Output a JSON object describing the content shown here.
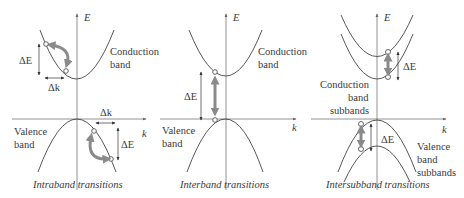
{
  "panels": [
    {
      "id": "intraband",
      "caption": "Intraband transitions",
      "axis_labels": {
        "energy": "E",
        "momentum": "k"
      },
      "band_labels": {
        "conduction_line1": "Conduction",
        "conduction_line2": "band",
        "valence_line1": "Valence",
        "valence_line2": "band"
      },
      "annotations": {
        "conduction_dE": "ΔE",
        "conduction_dk": "Δk",
        "valence_dk": "Δk",
        "valence_dE": "ΔE"
      }
    },
    {
      "id": "interband",
      "caption": "Interband transitions",
      "axis_labels": {
        "energy": "E",
        "momentum": "k"
      },
      "band_labels": {
        "conduction_line1": "Conduction",
        "conduction_line2": "band",
        "valence_line1": "Valence",
        "valence_line2": "band"
      },
      "annotations": {
        "dE": "ΔE"
      }
    },
    {
      "id": "intersubband",
      "caption": "Intersubband transitions",
      "axis_labels": {
        "energy": "E",
        "momentum": "k"
      },
      "band_labels": {
        "conduction_line1": "Conduction",
        "conduction_line2": "band",
        "conduction_line3": "subbands",
        "valence_line1": "Valence",
        "valence_line2": "band",
        "valence_line3": "subbands"
      },
      "annotations": {
        "conduction_dE": "ΔE",
        "valence_dE": "ΔE"
      }
    }
  ],
  "colors": {
    "transition_arrow": "#8a8a8a",
    "band_curve": "#444444",
    "axis": "#777777"
  }
}
